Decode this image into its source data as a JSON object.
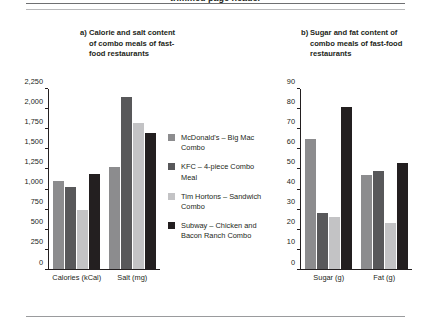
{
  "page": {
    "running_head": "trimmed page header"
  },
  "panels": [
    {
      "marker": "a)",
      "title": "Calorie and salt content of combo meals of fast-food restaurants"
    },
    {
      "marker": "b)",
      "title": "Sugar and fat content of combo meals of fast-food restaurants"
    }
  ],
  "legend": {
    "items": [
      {
        "label": "McDonald's – Big Mac Combo",
        "color": "#8c8c8e"
      },
      {
        "label": "KFC – 4-piece Combo Meal",
        "color": "#58585a"
      },
      {
        "label": "Tim Hortons – Sandwich Combo",
        "color": "#c3c3c5"
      },
      {
        "label": "Subway – Chicken and Bacon Ranch Combo",
        "color": "#231f20"
      }
    ]
  },
  "chart_data": [
    {
      "type": "bar",
      "panel": "a",
      "title": "a) Calorie and salt content of combo meals of fast-food restaurants",
      "categories": [
        "Calories (kCal)",
        "Salt (mg)"
      ],
      "series": [
        {
          "name": "McDonald's – Big Mac Combo",
          "color": "#8c8c8e",
          "values": [
            1100,
            1280
          ]
        },
        {
          "name": "KFC – 4-piece Combo Meal",
          "color": "#58585a",
          "values": [
            1030,
            2150
          ]
        },
        {
          "name": "Tim Hortons – Sandwich Combo",
          "color": "#c3c3c5",
          "values": [
            740,
            1830
          ]
        },
        {
          "name": "Subway – Chicken and Bacon Ranch Combo",
          "color": "#231f20",
          "values": [
            1190,
            1700
          ]
        }
      ],
      "xlabel": "",
      "ylabel": "",
      "ylim": [
        0,
        2250
      ],
      "yticks": [
        0,
        250,
        500,
        750,
        1000,
        1250,
        1500,
        1750,
        2000,
        2250
      ],
      "ytick_labels": [
        "0",
        "250",
        "500",
        "750",
        "1,000",
        "1,250",
        "1,500",
        "1,750",
        "2,000",
        "2,250"
      ],
      "grid": false,
      "legend_position": "center-between-panels"
    },
    {
      "type": "bar",
      "panel": "b",
      "title": "b) Sugar and fat content of combo meals of fast-food restaurants",
      "categories": [
        "Sugar (g)",
        "Fat (g)"
      ],
      "series": [
        {
          "name": "McDonald's – Big Mac Combo",
          "color": "#8c8c8e",
          "values": [
            65,
            47
          ]
        },
        {
          "name": "KFC – 4-piece Combo Meal",
          "color": "#58585a",
          "values": [
            28,
            49
          ]
        },
        {
          "name": "Tim Hortons – Sandwich Combo",
          "color": "#c3c3c5",
          "values": [
            26,
            23
          ]
        },
        {
          "name": "Subway – Chicken and Bacon Ranch Combo",
          "color": "#231f20",
          "values": [
            81,
            53
          ]
        }
      ],
      "xlabel": "",
      "ylabel": "",
      "ylim": [
        0,
        90
      ],
      "yticks": [
        0,
        10,
        20,
        30,
        40,
        50,
        60,
        70,
        80,
        90
      ],
      "ytick_labels": [
        "0",
        "10",
        "20",
        "30",
        "40",
        "50",
        "60",
        "70",
        "80",
        "90"
      ],
      "grid": false,
      "legend_position": "center-between-panels"
    }
  ]
}
